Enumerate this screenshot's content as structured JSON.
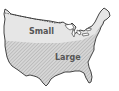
{
  "map": {
    "subject": "Continental United States",
    "regions": [
      {
        "name": "small",
        "label": "Small",
        "fill": "#e4e4e4",
        "pattern": "solid"
      },
      {
        "name": "large",
        "label": "Large",
        "fill": "#cfcfcf",
        "pattern": "diagonal-hatch"
      }
    ],
    "boundary_style": "dashed",
    "colors": {
      "outline": "#333333",
      "background": "#ffffff",
      "hatch": "#9a9a9a"
    }
  }
}
